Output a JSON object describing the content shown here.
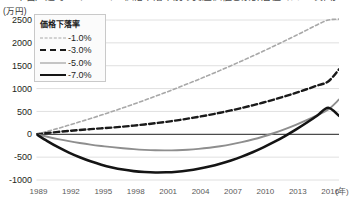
{
  "title_clipped": "中古戸建て・マンション価格下落率別の資産価値と累計居住コストの推移",
  "axes": {
    "y_unit_label": "(万円)",
    "y_ticks": [
      2500,
      2000,
      1500,
      1000,
      500,
      0,
      -500,
      -1000
    ],
    "x_ticks": [
      1989,
      1992,
      1995,
      1998,
      2001,
      2004,
      2007,
      2010,
      2013,
      2016
    ],
    "x_unit_label": "(年)"
  },
  "legend": {
    "title": "価格下落率",
    "items": [
      {
        "label": "-1.0%",
        "swatch": "dashed-light-gray-thin",
        "color": "#a8a8a8"
      },
      {
        "label": "-3.0%",
        "swatch": "dashed-black-bold",
        "color": "#1a1a1a"
      },
      {
        "label": "-5.0%",
        "swatch": "solid-gray",
        "color": "#8e8e8e"
      },
      {
        "label": "-7.0%",
        "swatch": "solid-black-thick",
        "color": "#141414"
      }
    ]
  },
  "chart_data": {
    "type": "line",
    "title": "中古戸建て・マンション価格下落率別の資産価値と累計居住コストの推移",
    "xlabel": "(年)",
    "ylabel": "(万円)",
    "xlim": [
      1989,
      2017
    ],
    "ylim": [
      -1000,
      2500
    ],
    "grid": true,
    "legend_position": "top-left-inside",
    "zero_line": true,
    "x": [
      1989,
      1990,
      1991,
      1992,
      1993,
      1994,
      1995,
      1996,
      1997,
      1998,
      1999,
      2000,
      2001,
      2002,
      2003,
      2004,
      2005,
      2006,
      2007,
      2008,
      2009,
      2010,
      2011,
      2012,
      2013,
      2014,
      2015,
      2016,
      2017
    ],
    "series": [
      {
        "name": "-1.0%",
        "style": "dashed",
        "color": "#a8a8a8",
        "width": 1.6,
        "values": [
          0,
          65,
          130,
          200,
          272,
          345,
          420,
          498,
          578,
          660,
          745,
          832,
          920,
          1012,
          1105,
          1200,
          1298,
          1398,
          1500,
          1605,
          1712,
          1820,
          1932,
          2045,
          2160,
          2278,
          2398,
          2500,
          2520
        ]
      },
      {
        "name": "-3.0%",
        "style": "dashed",
        "color": "#1a1a1a",
        "width": 2.4,
        "values": [
          0,
          28,
          52,
          74,
          94,
          112,
          130,
          148,
          168,
          190,
          215,
          242,
          272,
          305,
          342,
          382,
          425,
          472,
          522,
          576,
          634,
          696,
          762,
          832,
          906,
          985,
          1068,
          1155,
          1420
        ]
      },
      {
        "name": "-5.0%",
        "style": "solid",
        "color": "#8e8e8e",
        "width": 1.9,
        "values": [
          0,
          -55,
          -105,
          -150,
          -190,
          -225,
          -255,
          -282,
          -305,
          -325,
          -340,
          -350,
          -352,
          -348,
          -338,
          -320,
          -295,
          -262,
          -222,
          -172,
          -115,
          -48,
          28,
          112,
          205,
          308,
          420,
          540,
          760
        ]
      },
      {
        "name": "-7.0%",
        "style": "solid",
        "color": "#141414",
        "width": 2.6,
        "values": [
          0,
          -148,
          -282,
          -400,
          -502,
          -590,
          -665,
          -725,
          -772,
          -805,
          -825,
          -835,
          -832,
          -818,
          -792,
          -755,
          -705,
          -645,
          -572,
          -488,
          -392,
          -285,
          -168,
          -38,
          102,
          252,
          412,
          580,
          405
        ]
      }
    ]
  }
}
